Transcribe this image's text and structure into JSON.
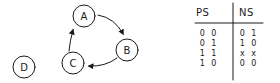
{
  "diagram": {
    "type": "state-diagram",
    "nodes": [
      {
        "id": "A",
        "label": "A",
        "cx": 84,
        "cy": 16
      },
      {
        "id": "B",
        "label": "B",
        "cx": 127,
        "cy": 50
      },
      {
        "id": "C",
        "label": "C",
        "cx": 73,
        "cy": 63
      },
      {
        "id": "D",
        "label": "D",
        "cx": 24,
        "cy": 67
      }
    ],
    "edges": [
      {
        "from": "A",
        "to": "B"
      },
      {
        "from": "B",
        "to": "C"
      },
      {
        "from": "C",
        "to": "A"
      }
    ]
  },
  "table": {
    "headers": {
      "ps": "PS",
      "ns": "NS"
    },
    "rows": [
      {
        "ps": "0 0",
        "ns": "0 1"
      },
      {
        "ps": "0 1",
        "ns": "1 0"
      },
      {
        "ps": "1 1",
        "ns": "x x"
      },
      {
        "ps": "1 0",
        "ns": "0 0"
      }
    ]
  },
  "colors": {
    "ink": "#1a1a1a",
    "background": "#ffffff"
  }
}
